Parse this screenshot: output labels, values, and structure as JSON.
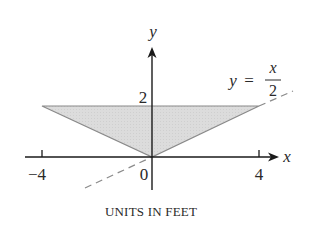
{
  "figure": {
    "caption": "UNITS IN FEET",
    "axes": {
      "x_label": "x",
      "y_label": "y",
      "x_ticks": [
        "-4",
        "0",
        "4"
      ],
      "y_ticks": [
        "2"
      ]
    },
    "line_label": {
      "lhs": "y",
      "equals": "=",
      "numerator": "x",
      "denominator": "2"
    },
    "shaded_region": {
      "vertices": [
        [
          -4,
          2
        ],
        [
          4,
          2
        ],
        [
          0,
          0
        ]
      ],
      "fill": "#d9d9d9",
      "edge": "#8a8a8a"
    },
    "dashed_line": {
      "equation": "y = x/2",
      "color": "#8a8a8a"
    },
    "colors": {
      "axis": "#1a1a1a",
      "text": "#2a2a2a"
    }
  }
}
